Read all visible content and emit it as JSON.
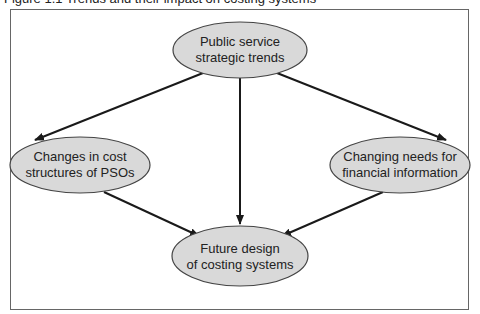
{
  "caption": "Figure 1.1  Trends and their impact on costing systems",
  "colors": {
    "node_fill": "#d9d9d9",
    "node_stroke": "#444444",
    "arrow": "#1a1a1a",
    "frame": "#666666"
  },
  "nodes": [
    {
      "id": "top",
      "line1": "Public service",
      "line2": "strategic trends",
      "cx": 240,
      "cy": 50,
      "rx": 67,
      "ry": 28
    },
    {
      "id": "left",
      "line1": "Changes in cost",
      "line2": "structures of PSOs",
      "cx": 80,
      "cy": 165,
      "rx": 70,
      "ry": 28
    },
    {
      "id": "right",
      "line1": "Changing needs for",
      "line2": "financial information",
      "cx": 400,
      "cy": 165,
      "rx": 70,
      "ry": 28
    },
    {
      "id": "bottom",
      "line1": "Future design",
      "line2": "of costing systems",
      "cx": 240,
      "cy": 256,
      "rx": 68,
      "ry": 30
    }
  ],
  "edges": [
    {
      "from": "top",
      "to": "left"
    },
    {
      "from": "top",
      "to": "right"
    },
    {
      "from": "top",
      "to": "bottom"
    },
    {
      "from": "left",
      "to": "bottom"
    },
    {
      "from": "right",
      "to": "bottom"
    }
  ]
}
